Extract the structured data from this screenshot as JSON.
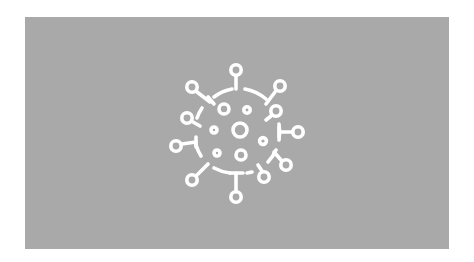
{
  "image": {
    "description": "Gray banner with a white virus (coronavirus) line icon centered",
    "background_color": "#ffffff",
    "panel_color": "#a9a9a9",
    "icon_color": "#ffffff",
    "icon": "virus-icon"
  }
}
